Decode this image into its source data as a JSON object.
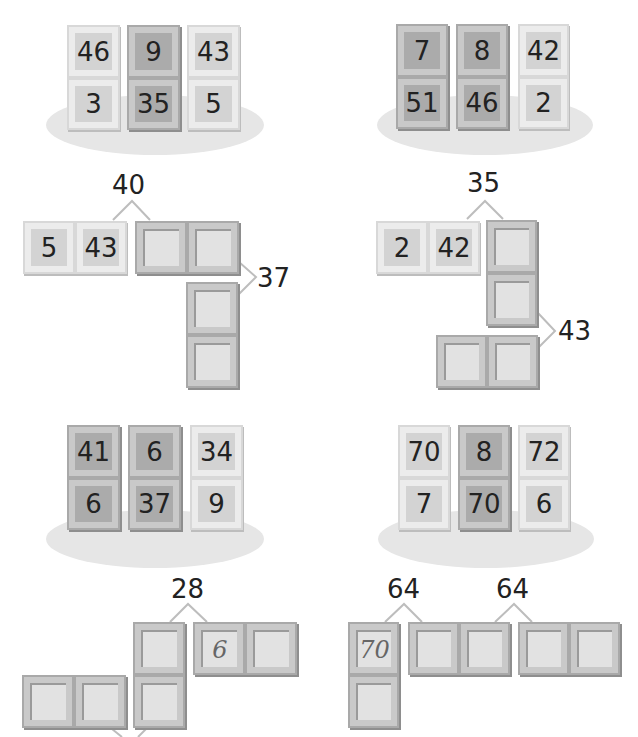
{
  "worksheet": {
    "panel1": {
      "dominoes": [
        {
          "top": "46",
          "bottom": "3",
          "shade": "light"
        },
        {
          "top": "9",
          "bottom": "35",
          "shade": "dark"
        },
        {
          "top": "43",
          "bottom": "5",
          "shade": "light"
        }
      ]
    },
    "panel2": {
      "dominoes": [
        {
          "top": "7",
          "bottom": "51",
          "shade": "dark"
        },
        {
          "top": "8",
          "bottom": "46",
          "shade": "dark"
        },
        {
          "top": "42",
          "bottom": "2",
          "shade": "light"
        }
      ]
    },
    "puzzle1": {
      "sum_top": "40",
      "sum_right": "37",
      "given": {
        "left": "5",
        "right": "43"
      },
      "blanks": [
        "",
        "",
        "",
        ""
      ]
    },
    "puzzle2": {
      "sum_top": "35",
      "sum_right": "43",
      "given": {
        "left": "2",
        "right": "42"
      },
      "blanks": [
        "",
        "",
        "",
        ""
      ]
    },
    "panel3": {
      "dominoes": [
        {
          "top": "41",
          "bottom": "6",
          "shade": "dark"
        },
        {
          "top": "6",
          "bottom": "37",
          "shade": "dark"
        },
        {
          "top": "34",
          "bottom": "9",
          "shade": "light"
        }
      ]
    },
    "panel4": {
      "dominoes": [
        {
          "top": "70",
          "bottom": "7",
          "shade": "light"
        },
        {
          "top": "8",
          "bottom": "70",
          "shade": "dark"
        },
        {
          "top": "72",
          "bottom": "6",
          "shade": "light"
        }
      ]
    },
    "puzzle3": {
      "sum_top": "28",
      "handwritten": "6",
      "blanks": [
        "",
        "",
        "",
        "",
        ""
      ]
    },
    "puzzle4": {
      "sum_left": "64",
      "sum_right": "64",
      "handwritten": "70",
      "blanks": [
        "",
        "",
        "",
        "",
        ""
      ]
    }
  }
}
